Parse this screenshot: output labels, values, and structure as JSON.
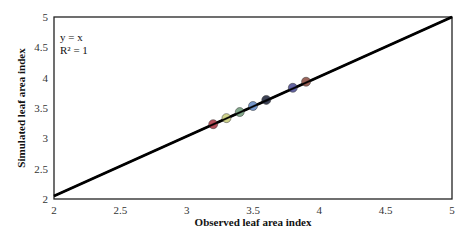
{
  "chart_data": {
    "type": "scatter",
    "title": "",
    "xlabel": "Observed leaf area index",
    "ylabel": "Simulated leaf area index",
    "xlim": [
      2,
      5
    ],
    "ylim": [
      2,
      5
    ],
    "x_ticks": [
      "2",
      "2.5",
      "3",
      "3.5",
      "4",
      "4.5",
      "5"
    ],
    "y_ticks": [
      "2",
      "2.5",
      "3",
      "3.5",
      "4",
      "4.5",
      "5"
    ],
    "grid": false,
    "legend": null,
    "annotations": [
      "y = x",
      "R² = 1"
    ],
    "trendline": {
      "type": "linear",
      "equation": "y = x",
      "r2": 1,
      "from": [
        2,
        2
      ],
      "to": [
        5,
        5
      ],
      "color": "#000000"
    },
    "series": [
      {
        "name": "points",
        "x": [
          3.2,
          3.3,
          3.4,
          3.5,
          3.6,
          3.8,
          3.9
        ],
        "y": [
          3.2,
          3.3,
          3.4,
          3.5,
          3.6,
          3.8,
          3.9
        ],
        "colors": [
          "#a8323f",
          "#c8cc7a",
          "#6e9a78",
          "#5f86c2",
          "#1c2238",
          "#4a4a92",
          "#8a4a3e"
        ]
      }
    ]
  }
}
